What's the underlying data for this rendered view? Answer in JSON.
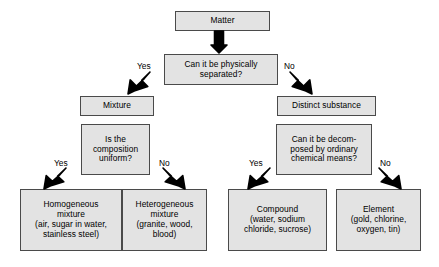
{
  "diagram": {
    "style": {
      "box_fill": "#e3e3e3",
      "box_border": "#4a4a4a",
      "text_color": "#000000",
      "background": "#ffffff",
      "arrow_color": "#000000"
    },
    "nodes": [
      {
        "id": "matter",
        "text": "Matter",
        "x": 175,
        "y": 11,
        "w": 95,
        "h": 20
      },
      {
        "id": "physically-separated",
        "text": "Can it be physically\nseparated?",
        "x": 164,
        "y": 54,
        "w": 114,
        "h": 31
      },
      {
        "id": "mixture",
        "text": "Mixture",
        "x": 80,
        "y": 96,
        "w": 74,
        "h": 20
      },
      {
        "id": "distinct-substance",
        "text": "Distinct substance",
        "x": 277,
        "y": 96,
        "w": 99,
        "h": 20
      },
      {
        "id": "composition-uniform",
        "text": "Is the\ncomposition\nuniform?",
        "x": 81,
        "y": 124,
        "w": 69,
        "h": 51
      },
      {
        "id": "decomposed-chemical",
        "text": "Can it be decom-\nposed by ordinary\nchemical means?",
        "x": 276,
        "y": 124,
        "w": 96,
        "h": 51
      },
      {
        "id": "homogeneous-mixture",
        "text": "Homogeneous\nmixture\n(air, sugar in water,\nstainless steel)",
        "x": 20,
        "y": 189,
        "w": 102,
        "h": 62
      },
      {
        "id": "heterogeneous-mixture",
        "text": "Heterogeneous\nmixture\n(granite, wood,\nblood)",
        "x": 122,
        "y": 189,
        "w": 85,
        "h": 62
      },
      {
        "id": "compound",
        "text": "Compound\n(water, sodium\nchloride, sucrose)",
        "x": 228,
        "y": 189,
        "w": 99,
        "h": 62
      },
      {
        "id": "element",
        "text": "Element\n(gold, chlorine,\noxygen, tin)",
        "x": 336,
        "y": 189,
        "w": 85,
        "h": 62
      }
    ],
    "edge_labels": [
      {
        "id": "yes-separate",
        "text": "Yes",
        "x": 137,
        "y": 62
      },
      {
        "id": "no-separate",
        "text": "No",
        "x": 284,
        "y": 62
      },
      {
        "id": "yes-uniform",
        "text": "Yes",
        "x": 54,
        "y": 159
      },
      {
        "id": "no-uniform",
        "text": "No",
        "x": 159,
        "y": 159
      },
      {
        "id": "yes-decompose",
        "text": "Yes",
        "x": 249,
        "y": 159
      },
      {
        "id": "no-decompose",
        "text": "No",
        "x": 380,
        "y": 159
      }
    ],
    "arrows": [
      {
        "id": "matter-to-question",
        "kind": "down",
        "x": 211,
        "y": 31,
        "w": 16,
        "h": 22
      },
      {
        "id": "question-to-mixture",
        "kind": "down-left",
        "x": 128,
        "y": 72,
        "w": 22,
        "h": 22
      },
      {
        "id": "question-to-distinct",
        "kind": "down-right",
        "x": 290,
        "y": 72,
        "w": 22,
        "h": 22
      },
      {
        "id": "uniform-to-homogeneous",
        "kind": "down-left",
        "x": 44,
        "y": 168,
        "w": 22,
        "h": 21
      },
      {
        "id": "uniform-to-heterogeneous",
        "kind": "down-right",
        "x": 163,
        "y": 168,
        "w": 22,
        "h": 21
      },
      {
        "id": "decompose-to-compound",
        "kind": "down-left",
        "x": 248,
        "y": 168,
        "w": 22,
        "h": 21
      },
      {
        "id": "decompose-to-element",
        "kind": "down-right",
        "x": 379,
        "y": 168,
        "w": 22,
        "h": 21
      }
    ]
  }
}
